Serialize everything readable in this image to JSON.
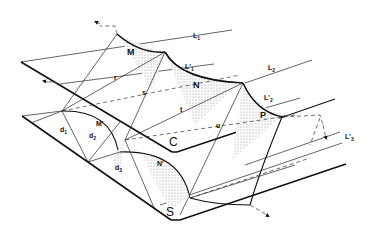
{
  "figure": {
    "type": "isometric geometric construction diagram",
    "labels": {
      "M": "M",
      "N": "N",
      "P": "P",
      "M_prime": "M'",
      "N_prime": "N'",
      "L1": "L",
      "L1_sub": "1",
      "L1_prime": "L'",
      "L1_prime_sub": "1",
      "L2": "L",
      "L2_sub": "2",
      "L2_prime": "L'",
      "L2_prime_sub": "2",
      "L3_prime": "L'",
      "L3_prime_sub": "3",
      "r": "r",
      "s": "s",
      "t": "t",
      "u": "u",
      "d1": "d",
      "d1_sub": "1",
      "d2": "d",
      "d2_sub": "2",
      "d3": "d",
      "d3_sub": "3",
      "C": "C",
      "S": "S"
    },
    "colors": {
      "line": "#111111",
      "background": "#ffffff",
      "shading": "#9a9a9a"
    }
  }
}
